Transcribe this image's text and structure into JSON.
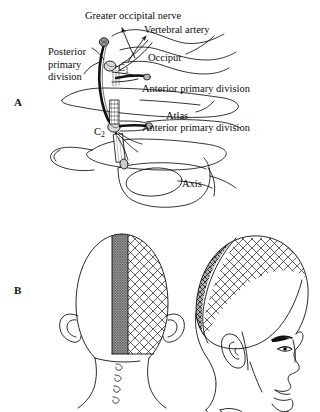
{
  "figure": {
    "title_absent": true,
    "background_color": "#ffffff",
    "ink_color": "#101010"
  },
  "panels": [
    {
      "id": "A",
      "letter": "A",
      "description": "Lateral view of upper cervical spine showing C1 (atlas) and C2 (axis) vertebrae with the greater occipital nerve, vertebral artery, and anterior/posterior primary divisions",
      "labels": [
        {
          "name": "greater-occipital-nerve",
          "text": "Greater occipital nerve",
          "x": 85,
          "y": 10
        },
        {
          "name": "vertebral-artery",
          "text": "Vertebral artery",
          "x": 144,
          "y": 24
        },
        {
          "name": "posterior-primary-division",
          "text": "Posterior\nprimary\ndivision",
          "x": 48,
          "y": 46
        },
        {
          "name": "occiput",
          "text": "Occiput",
          "x": 148,
          "y": 52
        },
        {
          "name": "c1-vertebra",
          "text": "C",
          "subscript": "1",
          "x": 118,
          "y": 69
        },
        {
          "name": "anterior-primary-division-upper",
          "text": "Anterior primary division",
          "x": 142,
          "y": 83
        },
        {
          "name": "atlas",
          "text": "Atlas",
          "x": 166,
          "y": 110
        },
        {
          "name": "anterior-primary-division-lower",
          "text": "Anterior primary division",
          "x": 142,
          "y": 122
        },
        {
          "name": "c2-vertebra",
          "text": "C",
          "subscript": "2",
          "x": 97,
          "y": 123
        },
        {
          "name": "axis",
          "text": "Axis",
          "x": 182,
          "y": 178
        }
      ]
    },
    {
      "id": "B",
      "letter": "B",
      "description": "Posterior and lateral views of the head showing sensory distribution territories; dark stippled midline strip and cross-hatched lateral occipital-parietal region",
      "views": [
        {
          "name": "posterior-head-view",
          "shading": [
            "dark-stipple-midline-strip",
            "crosshatch-right-hemisphere"
          ]
        },
        {
          "name": "lateral-head-view",
          "shading": [
            "dark-crosshatch-occipital",
            "light-crosshatch-parietal"
          ]
        }
      ],
      "labels": []
    }
  ],
  "colors": {
    "ink": "#101010",
    "dark_shade_fill": "#b8b8b8",
    "light_shade_fill": "#ffffff",
    "hatch_stroke": "#2a2a2a"
  }
}
